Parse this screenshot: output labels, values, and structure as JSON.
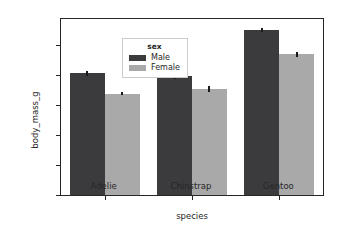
{
  "chart_data": {
    "type": "bar",
    "title": "",
    "xlabel": "species",
    "ylabel": "body_mass_g",
    "categories": [
      "Adelie",
      "Chinstrap",
      "Gentoo"
    ],
    "ylim": [
      0,
      5850
    ],
    "yticks": [
      0,
      1000,
      2000,
      3000,
      4000,
      5000
    ],
    "ytick_labels": [
      "0",
      "1000",
      "2000",
      "3000",
      "4000",
      "5000"
    ],
    "grid": false,
    "legend": {
      "title": "sex",
      "position": "upper left",
      "entries": [
        {
          "label": "Male",
          "color": "#3b3b3d"
        },
        {
          "label": "Female",
          "color": "#a9a9a9"
        }
      ]
    },
    "series": [
      {
        "name": "Male",
        "color": "#3b3b3d",
        "values": [
          4043,
          3939,
          5485
        ],
        "errors": [
          75,
          90,
          65
        ]
      },
      {
        "name": "Female",
        "color": "#a9a9a9",
        "values": [
          3369,
          3527,
          4680
        ],
        "errors": [
          60,
          95,
          80
        ]
      }
    ]
  },
  "axes": {
    "frame_color": "#262626",
    "background": "#ffffff"
  }
}
